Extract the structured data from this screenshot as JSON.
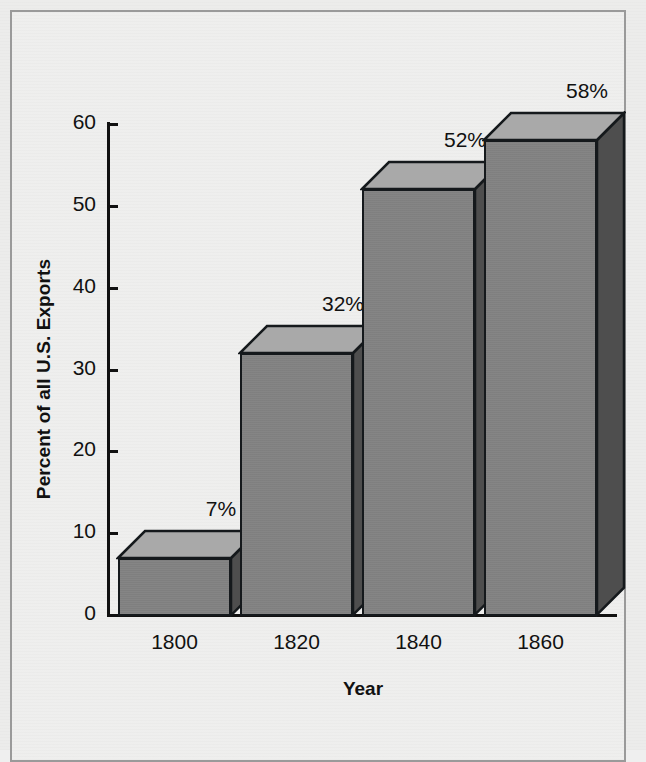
{
  "chart_data": {
    "type": "bar",
    "title": "",
    "subtitle": "",
    "xlabel": "Year",
    "ylabel": "Percent of all U.S. Exports",
    "categories": [
      "1800",
      "1820",
      "1840",
      "1860"
    ],
    "values": [
      7,
      32,
      52,
      58
    ],
    "data_labels": [
      "7%",
      "32%",
      "52%",
      "58%"
    ],
    "ylim": [
      0,
      60
    ],
    "ytick_values": [
      0,
      10,
      20,
      30,
      40,
      50,
      60
    ],
    "ytick_labels": [
      "0",
      "10",
      "20",
      "30",
      "40",
      "50",
      "60"
    ],
    "grid": false,
    "legend": null,
    "style": "3d-isometric-bars",
    "colors": {
      "bar_front": "#828282",
      "bar_top": "#a9a9a9",
      "bar_side": "#4e4e4e",
      "outline": "#15191c",
      "background": "#eeeeed",
      "border": "#9a9a9a",
      "text": "#111111"
    }
  },
  "figure": {
    "frame_label": "chart-frame"
  }
}
